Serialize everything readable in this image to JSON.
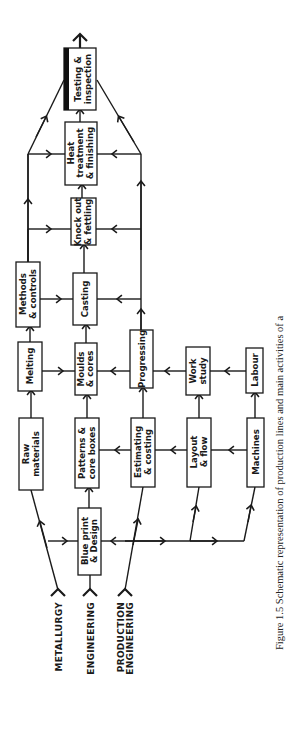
{
  "figure": {
    "caption_line1": "Figure 1.5 Schematic representation of production lines and main activities of a",
    "caption_line2": "foundry",
    "orientation": "rotated 90° counter-clockwise"
  },
  "sources": [
    {
      "id": "metallurgy",
      "label": "METALLURGY"
    },
    {
      "id": "engineering",
      "label": "ENGINEERING"
    },
    {
      "id": "production_engineering",
      "line1": "PRODUCTION",
      "line2": "ENGINEERING"
    }
  ],
  "nodes": {
    "testing": {
      "line1": "Testing &",
      "line2": "inspection"
    },
    "heat": {
      "line1": "Heat",
      "line2": "treatment",
      "line3": "& finishing"
    },
    "knockout": {
      "line1": "Knock out",
      "line2": "& fettling"
    },
    "methods": {
      "line1": "Methods",
      "line2": "& controls"
    },
    "casting": {
      "line1": "Casting"
    },
    "melting": {
      "line1": "Melting"
    },
    "moulds": {
      "line1": "Moulds",
      "line2": "& cores"
    },
    "progressing": {
      "line1": "Progressing"
    },
    "workstudy": {
      "line1": "Work",
      "line2": "study"
    },
    "labour": {
      "line1": "Labour"
    },
    "raw": {
      "line1": "Raw",
      "line2": "materials"
    },
    "patterns": {
      "line1": "Patterns &",
      "line2": "core boxes"
    },
    "estimating": {
      "line1": "Estimating",
      "line2": "& costing"
    },
    "layout": {
      "line1": "Layout",
      "line2": "& flow"
    },
    "machines": {
      "line1": "Machines"
    },
    "blueprint": {
      "line1": "Blue print",
      "line2": "& Design"
    }
  },
  "edges": [
    [
      "metallurgy",
      "raw"
    ],
    [
      "raw",
      "melting"
    ],
    [
      "melting",
      "methods"
    ],
    [
      "engineering",
      "blueprint"
    ],
    [
      "blueprint",
      "patterns"
    ],
    [
      "patterns",
      "moulds"
    ],
    [
      "moulds",
      "casting"
    ],
    [
      "casting",
      "knockout"
    ],
    [
      "knockout",
      "heat"
    ],
    [
      "heat",
      "testing"
    ],
    [
      "production_engineering",
      "estimating"
    ],
    [
      "estimating",
      "progressing"
    ],
    [
      "layout",
      "workstudy"
    ],
    [
      "machines",
      "labour"
    ],
    [
      "blueprint",
      "layout"
    ],
    [
      "blueprint",
      "machines"
    ],
    [
      "estimating",
      "patterns"
    ],
    [
      "layout",
      "estimating"
    ],
    [
      "machines",
      "layout"
    ],
    [
      "progressing",
      "moulds"
    ],
    [
      "workstudy",
      "progressing"
    ],
    [
      "labour",
      "workstudy"
    ],
    [
      "melting",
      "moulds"
    ],
    [
      "methods",
      "casting"
    ],
    [
      "progressing",
      "casting"
    ],
    [
      "methods",
      "knockout"
    ],
    [
      "methods",
      "heat"
    ],
    [
      "methods",
      "testing"
    ],
    [
      "progressing",
      "knockout"
    ],
    [
      "progressing",
      "heat"
    ],
    [
      "progressing",
      "testing"
    ]
  ]
}
